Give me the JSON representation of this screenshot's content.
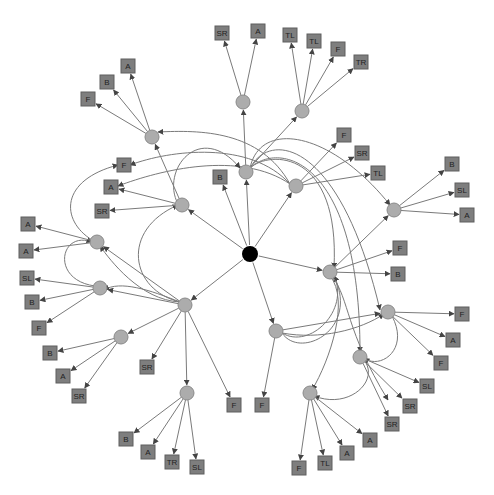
{
  "diagram": {
    "type": "directed-graph",
    "colors": {
      "root": "#000000",
      "hub": "#acacac",
      "leaf": "#7e7e7e",
      "edge": "#7a7a7a",
      "background": "#ffffff"
    },
    "root": {
      "id": "root",
      "x": 250,
      "y": 254
    },
    "hubs": [
      {
        "id": "h1",
        "x": 243,
        "y": 102
      },
      {
        "id": "h2",
        "x": 302,
        "y": 111
      },
      {
        "id": "h3",
        "x": 152,
        "y": 137
      },
      {
        "id": "h4",
        "x": 246,
        "y": 172
      },
      {
        "id": "h5",
        "x": 296,
        "y": 186
      },
      {
        "id": "h6",
        "x": 182,
        "y": 205
      },
      {
        "id": "h7",
        "x": 394,
        "y": 210
      },
      {
        "id": "h8",
        "x": 97,
        "y": 242
      },
      {
        "id": "h9",
        "x": 330,
        "y": 272
      },
      {
        "id": "h10",
        "x": 100,
        "y": 288
      },
      {
        "id": "h11",
        "x": 185,
        "y": 305
      },
      {
        "id": "h12",
        "x": 388,
        "y": 312
      },
      {
        "id": "h13",
        "x": 276,
        "y": 331
      },
      {
        "id": "h14",
        "x": 121,
        "y": 337
      },
      {
        "id": "h15",
        "x": 360,
        "y": 357
      },
      {
        "id": "h16",
        "x": 310,
        "y": 393
      },
      {
        "id": "h17",
        "x": 187,
        "y": 393
      }
    ],
    "leaves": [
      {
        "id": "l1",
        "label": "SR",
        "x": 222,
        "y": 33
      },
      {
        "id": "l2",
        "label": "A",
        "x": 258,
        "y": 31
      },
      {
        "id": "l3",
        "label": "TL",
        "x": 290,
        "y": 35
      },
      {
        "id": "l4",
        "label": "TL",
        "x": 314,
        "y": 41
      },
      {
        "id": "l5",
        "label": "F",
        "x": 338,
        "y": 49
      },
      {
        "id": "l6",
        "label": "TR",
        "x": 361,
        "y": 62
      },
      {
        "id": "l7",
        "label": "A",
        "x": 128,
        "y": 66
      },
      {
        "id": "l8",
        "label": "B",
        "x": 107,
        "y": 82
      },
      {
        "id": "l9",
        "label": "F",
        "x": 88,
        "y": 99
      },
      {
        "id": "l10",
        "label": "F",
        "x": 344,
        "y": 135
      },
      {
        "id": "l11",
        "label": "SR",
        "x": 362,
        "y": 153
      },
      {
        "id": "l12",
        "label": "TL",
        "x": 378,
        "y": 173
      },
      {
        "id": "l13",
        "label": "F",
        "x": 124,
        "y": 165
      },
      {
        "id": "l14",
        "label": "B",
        "x": 220,
        "y": 177
      },
      {
        "id": "l15",
        "label": "B",
        "x": 452,
        "y": 164
      },
      {
        "id": "l16",
        "label": "SL",
        "x": 462,
        "y": 190
      },
      {
        "id": "l17",
        "label": "A",
        "x": 467,
        "y": 215
      },
      {
        "id": "l18",
        "label": "A",
        "x": 111,
        "y": 187
      },
      {
        "id": "l19",
        "label": "SR",
        "x": 102,
        "y": 211
      },
      {
        "id": "l20",
        "label": "A",
        "x": 28,
        "y": 224
      },
      {
        "id": "l21",
        "label": "A",
        "x": 26,
        "y": 251
      },
      {
        "id": "l22",
        "label": "F",
        "x": 400,
        "y": 248
      },
      {
        "id": "l23",
        "label": "B",
        "x": 398,
        "y": 274
      },
      {
        "id": "l24",
        "label": "SL",
        "x": 27,
        "y": 278
      },
      {
        "id": "l25",
        "label": "B",
        "x": 32,
        "y": 302
      },
      {
        "id": "l26",
        "label": "F",
        "x": 39,
        "y": 328
      },
      {
        "id": "l27",
        "label": "F",
        "x": 462,
        "y": 314
      },
      {
        "id": "l28",
        "label": "SR",
        "x": 147,
        "y": 367
      },
      {
        "id": "l29",
        "label": "A",
        "x": 453,
        "y": 340
      },
      {
        "id": "l30",
        "label": "B",
        "x": 50,
        "y": 353
      },
      {
        "id": "l31",
        "label": "F",
        "x": 441,
        "y": 363
      },
      {
        "id": "l32",
        "label": "A",
        "x": 63,
        "y": 376
      },
      {
        "id": "l33",
        "label": "SL",
        "x": 427,
        "y": 386
      },
      {
        "id": "l34",
        "label": "SR",
        "x": 79,
        "y": 396
      },
      {
        "id": "l35",
        "label": "SR",
        "x": 410,
        "y": 406
      },
      {
        "id": "l36",
        "label": "F",
        "x": 234,
        "y": 405
      },
      {
        "id": "l37",
        "label": "F",
        "x": 262,
        "y": 405
      },
      {
        "id": "l38",
        "label": "SR",
        "x": 392,
        "y": 424
      },
      {
        "id": "l39",
        "label": "A",
        "x": 370,
        "y": 440
      },
      {
        "id": "l40",
        "label": "B",
        "x": 126,
        "y": 439
      },
      {
        "id": "l41",
        "label": "A",
        "x": 148,
        "y": 452
      },
      {
        "id": "l42",
        "label": "A",
        "x": 347,
        "y": 453
      },
      {
        "id": "l43",
        "label": "TR",
        "x": 172,
        "y": 462
      },
      {
        "id": "l44",
        "label": "TL",
        "x": 325,
        "y": 463
      },
      {
        "id": "l45",
        "label": "SL",
        "x": 197,
        "y": 467
      },
      {
        "id": "l46",
        "label": "F",
        "x": 299,
        "y": 468
      }
    ],
    "edges": [
      {
        "from": "root",
        "to": "h4"
      },
      {
        "from": "root",
        "to": "h5"
      },
      {
        "from": "root",
        "to": "h6"
      },
      {
        "from": "root",
        "to": "h9"
      },
      {
        "from": "root",
        "to": "h11"
      },
      {
        "from": "root",
        "to": "h13"
      },
      {
        "from": "root",
        "to": "l14"
      },
      {
        "from": "h4",
        "to": "h1"
      },
      {
        "from": "h4",
        "to": "h2"
      },
      {
        "from": "h6",
        "to": "h3"
      },
      {
        "from": "h1",
        "to": "l1"
      },
      {
        "from": "h1",
        "to": "l2"
      },
      {
        "from": "h2",
        "to": "l3"
      },
      {
        "from": "h2",
        "to": "l4"
      },
      {
        "from": "h2",
        "to": "l5"
      },
      {
        "from": "h2",
        "to": "l6"
      },
      {
        "from": "h3",
        "to": "l7"
      },
      {
        "from": "h3",
        "to": "l8"
      },
      {
        "from": "h3",
        "to": "l9"
      },
      {
        "from": "h5",
        "to": "l10"
      },
      {
        "from": "h5",
        "to": "l11"
      },
      {
        "from": "h5",
        "to": "l12"
      },
      {
        "from": "h7",
        "to": "l15"
      },
      {
        "from": "h7",
        "to": "l16"
      },
      {
        "from": "h7",
        "to": "l17"
      },
      {
        "from": "h6",
        "to": "l18"
      },
      {
        "from": "h6",
        "to": "l19"
      },
      {
        "from": "h8",
        "to": "l20"
      },
      {
        "from": "h8",
        "to": "l21"
      },
      {
        "from": "h9",
        "to": "l22"
      },
      {
        "from": "h9",
        "to": "l23"
      },
      {
        "from": "h9",
        "to": "h7"
      },
      {
        "from": "h10",
        "to": "l24"
      },
      {
        "from": "h10",
        "to": "l25"
      },
      {
        "from": "h10",
        "to": "l26"
      },
      {
        "from": "h11",
        "to": "h10"
      },
      {
        "from": "h11",
        "to": "h8"
      },
      {
        "from": "h11",
        "to": "h14"
      },
      {
        "from": "h11",
        "to": "h17"
      },
      {
        "from": "h11",
        "to": "l28"
      },
      {
        "from": "h11",
        "to": "l36"
      },
      {
        "from": "h12",
        "to": "l27"
      },
      {
        "from": "h12",
        "to": "l29"
      },
      {
        "from": "h12",
        "to": "l31"
      },
      {
        "from": "h13",
        "to": "h12"
      },
      {
        "from": "h13",
        "to": "l37"
      },
      {
        "from": "h14",
        "to": "l30"
      },
      {
        "from": "h14",
        "to": "l32"
      },
      {
        "from": "h14",
        "to": "l34"
      },
      {
        "from": "h15",
        "to": "l33"
      },
      {
        "from": "h15",
        "to": "l35"
      },
      {
        "from": "h15",
        "to": "l38"
      },
      {
        "from": "h16",
        "to": "l39"
      },
      {
        "from": "h16",
        "to": "l42"
      },
      {
        "from": "h16",
        "to": "l44"
      },
      {
        "from": "h16",
        "to": "l46"
      },
      {
        "from": "h17",
        "to": "l40"
      },
      {
        "from": "h17",
        "to": "l41"
      },
      {
        "from": "h17",
        "to": "l43"
      },
      {
        "from": "h17",
        "to": "l45"
      }
    ],
    "curved_edges": [
      {
        "d": "M 290 184 C 260 130, 200 130, 158 132"
      },
      {
        "d": "M 290 184 C 250 140, 170 150, 130 165"
      },
      {
        "d": "M 290 184 C 240 150, 160 170, 118 186"
      },
      {
        "d": "M 250 168 C 260 120, 330 130, 390 205"
      },
      {
        "d": "M 250 168 C 270 130, 340 140, 380 310"
      },
      {
        "d": "M 250 168 C 280 140, 360 160, 360 352"
      },
      {
        "d": "M 250 168 C 270 150, 340 150, 334 268"
      },
      {
        "d": "M 178 204 C 160 170, 200 120, 240 168"
      },
      {
        "d": "M 92 240 C 60 220, 60 180, 118 165"
      },
      {
        "d": "M 95 286 C 50 280, 60 230, 92 242"
      },
      {
        "d": "M 180 302 C 130 290, 120 230, 178 205"
      },
      {
        "d": "M 180 302 C 150 290, 120 280, 104 290"
      },
      {
        "d": "M 180 302 C 140 300, 110 260, 100 246"
      },
      {
        "d": "M 282 333 C 300 360, 360 330, 334 276"
      },
      {
        "d": "M 282 333 C 310 350, 350 310, 334 276"
      },
      {
        "d": "M 282 333 C 320 340, 360 330, 384 314"
      },
      {
        "d": "M 330 276 C 350 300, 330 360, 312 390"
      },
      {
        "d": "M 392 316 C 410 350, 380 370, 364 358"
      },
      {
        "d": "M 364 360 C 380 380, 350 410, 314 396"
      },
      {
        "d": "M 332 276 C 350 300, 345 330, 388 400"
      }
    ]
  }
}
